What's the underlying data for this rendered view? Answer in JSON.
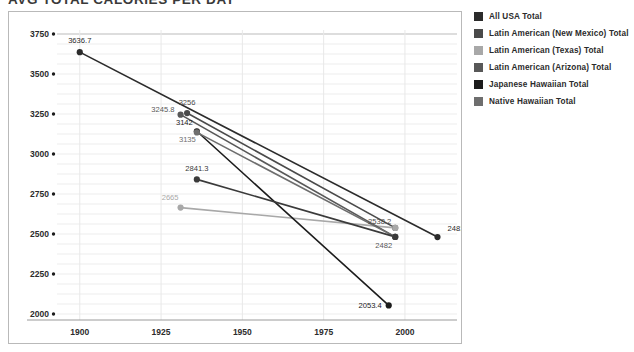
{
  "title": "AVG TOTAL CALORIES PER DAY",
  "legend": {
    "items": [
      {
        "label": "All USA Total",
        "color": "#2b2b2b"
      },
      {
        "label": "Latin American (New Mexico) Total",
        "color": "#4a4a4a"
      },
      {
        "label": "Latin American (Texas) Total",
        "color": "#a8a8a8"
      },
      {
        "label": "Latin American (Arizona) Total",
        "color": "#585858"
      },
      {
        "label": "Japanese Hawaiian Total",
        "color": "#1c1c1c"
      },
      {
        "label": "Native Hawaiian Total",
        "color": "#6e6e6e"
      }
    ]
  },
  "axes": {
    "y_ticks": [
      "3750",
      "3500",
      "3250",
      "3000",
      "2750",
      "2500",
      "2250",
      "2000"
    ],
    "x_ticks": [
      "1900",
      "1925",
      "1950",
      "1975",
      "2000"
    ]
  },
  "chart_data": {
    "type": "line",
    "title": "AVG TOTAL CALORIES PER DAY",
    "xlabel": "",
    "ylabel": "",
    "xlim": [
      1893,
      2016
    ],
    "ylim": [
      2000,
      3750
    ],
    "grid": true,
    "legend_position": "right",
    "series": [
      {
        "name": "All USA Total",
        "color": "#2b2b2b",
        "x": [
          1900,
          2010
        ],
        "values": [
          3636.7,
          2481
        ],
        "labels": [
          "3636.7",
          "2481"
        ]
      },
      {
        "name": "Latin American (New Mexico) Total",
        "color": "#4a4a4a",
        "x": [
          1933,
          1997
        ],
        "values": [
          3256,
          2538.2
        ],
        "labels": [
          "3256",
          "2538.2"
        ]
      },
      {
        "name": "Latin American (Texas) Total",
        "color": "#a8a8a8",
        "x": [
          1931,
          1997
        ],
        "values": [
          2665,
          2538.2
        ],
        "labels": [
          "2665",
          "2538.2"
        ]
      },
      {
        "name": "Latin American (Arizona) Total",
        "color": "#585858",
        "x": [
          1931,
          1997
        ],
        "values": [
          3245.8,
          2482
        ],
        "labels": [
          "3245.8",
          "2482"
        ]
      },
      {
        "name": "Japanese Hawaiian Total",
        "color": "#1c1c1c",
        "x": [
          1936,
          1995
        ],
        "values": [
          3142,
          2053.4
        ],
        "labels": [
          "3142",
          "2053.4"
        ]
      },
      {
        "name": "Native Hawaiian Total",
        "color": "#6e6e6e",
        "x": [
          1936,
          1997
        ],
        "values": [
          3135,
          2482
        ],
        "labels": [
          "3135",
          "2482"
        ]
      },
      {
        "name": "Latin American (NM) secondary",
        "color": "#3a3a3a",
        "x": [
          1936,
          1997
        ],
        "values": [
          2841.3,
          2482
        ],
        "labels": [
          "2841.3",
          "2482"
        ]
      }
    ]
  }
}
